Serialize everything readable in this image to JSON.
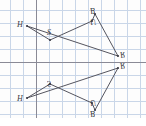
{
  "figure": {
    "type": "geometry-diagram",
    "background_color": "#fdfdfd",
    "grid": {
      "visible": true,
      "minor_color": "#c9d6e8",
      "major_color": "#9aa8bd",
      "spacing_px": 13,
      "axis_color": "#8a8a96",
      "x_axis_y_px": 62,
      "y_axis_x_px": 36
    },
    "stroke_color": "#55555f",
    "vertex_dot_color": "#3a3a44",
    "preimage": {
      "name": "pentagon-preimage",
      "vertices": [
        {
          "label": "H",
          "x": 27,
          "y": 26,
          "label_dx": -10,
          "label_dy": -5,
          "flipped": false
        },
        {
          "label": "S",
          "x": 50,
          "y": 40,
          "label_dx": -3,
          "label_dy": -11,
          "flipped": false
        },
        {
          "label": "U",
          "x": 92,
          "y": 21,
          "label_dx": -2,
          "label_dy": -10,
          "flipped": true
        },
        {
          "label": "B",
          "x": 95,
          "y": 14,
          "label_dx": -2,
          "label_dy": -10,
          "flipped": true
        },
        {
          "label": "R",
          "x": 118,
          "y": 56,
          "label_dx": 2,
          "label_dy": -9,
          "flipped": true
        }
      ]
    },
    "image": {
      "name": "pentagon-image",
      "vertices": [
        {
          "label": "H",
          "x": 27,
          "y": 98,
          "label_dx": -10,
          "label_dy": -5,
          "flipped": false
        },
        {
          "label": "S",
          "x": 50,
          "y": 84,
          "label_dx": -3,
          "label_dy": -11,
          "flipped": true
        },
        {
          "label": "U",
          "x": 92,
          "y": 103,
          "label_dx": -2,
          "label_dy": -9,
          "flipped": true
        },
        {
          "label": "B",
          "x": 95,
          "y": 110,
          "label_dx": -2,
          "label_dy": -2,
          "flipped": true
        },
        {
          "label": "R",
          "x": 118,
          "y": 68,
          "label_dx": 2,
          "label_dy": -1,
          "flipped": true
        }
      ]
    },
    "labels": [
      {
        "text": "H",
        "x": 17,
        "y": 21,
        "flipped": false,
        "name": "vertex-label-h-top"
      },
      {
        "text": "S",
        "x": 47,
        "y": 29,
        "flipped": false,
        "name": "vertex-label-s-top"
      },
      {
        "text": "B",
        "x": 90,
        "y": 6,
        "flipped": true,
        "name": "vertex-label-b-top"
      },
      {
        "text": "U",
        "x": 90,
        "y": 17,
        "flipped": true,
        "name": "vertex-label-u-top"
      },
      {
        "text": "R",
        "x": 120,
        "y": 50,
        "flipped": true,
        "name": "vertex-label-r-top"
      },
      {
        "text": "R",
        "x": 120,
        "y": 61,
        "flipped": true,
        "name": "vertex-label-r-bottom"
      },
      {
        "text": "H",
        "x": 17,
        "y": 95,
        "flipped": false,
        "name": "vertex-label-h-bottom"
      },
      {
        "text": "S",
        "x": 47,
        "y": 79,
        "flipped": true,
        "name": "vertex-label-s-bottom"
      },
      {
        "text": "U",
        "x": 90,
        "y": 98,
        "flipped": true,
        "name": "vertex-label-u-bottom"
      },
      {
        "text": "B",
        "x": 90,
        "y": 109,
        "flipped": true,
        "name": "vertex-label-b-bottom"
      }
    ]
  }
}
